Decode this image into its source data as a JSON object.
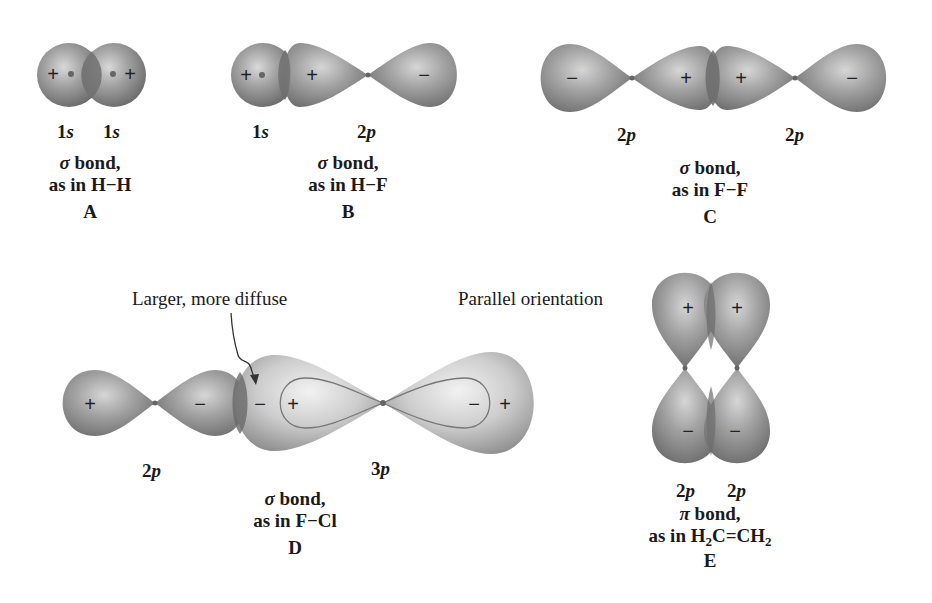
{
  "figure": {
    "panels": [
      {
        "id": "A",
        "orbitals": [
          "1s",
          "1s"
        ],
        "bond_type": "σ bond,",
        "example": "as in H−H",
        "letter": "A",
        "signs": [
          "+",
          "+"
        ]
      },
      {
        "id": "B",
        "orbitals": [
          "1s",
          "2p"
        ],
        "bond_type": "σ bond,",
        "example": "as in H−F",
        "letter": "B",
        "signs": [
          "+",
          "+",
          "−"
        ]
      },
      {
        "id": "C",
        "orbitals": [
          "2p",
          "2p"
        ],
        "bond_type": "σ bond,",
        "example": "as in F−F",
        "letter": "C",
        "signs": [
          "−",
          "+",
          "+",
          "−"
        ]
      },
      {
        "id": "D",
        "orbitals": [
          "2p",
          "3p"
        ],
        "bond_type": "σ bond,",
        "example": "as in F−Cl",
        "letter": "D",
        "annotation": "Larger, more diffuse",
        "signs": [
          "+",
          "−",
          "−",
          "+",
          "−",
          "+"
        ]
      },
      {
        "id": "E",
        "orbitals": [
          "2p",
          "2p"
        ],
        "bond_type": "π bond,",
        "example_prefix": "as in H",
        "example_sub1": "2",
        "example_mid": "C=CH",
        "example_sub2": "2",
        "letter": "E",
        "annotation": "Parallel orientation",
        "signs": [
          "+",
          "+",
          "−",
          "−"
        ]
      }
    ],
    "colors": {
      "lobe_fill": "#8f8f8f",
      "lobe_highlight": "#d4d4d4",
      "large_lobe_fill": "#c8c8c8",
      "overlap": "#6c6c6c",
      "text": "#1a1a1a"
    }
  }
}
